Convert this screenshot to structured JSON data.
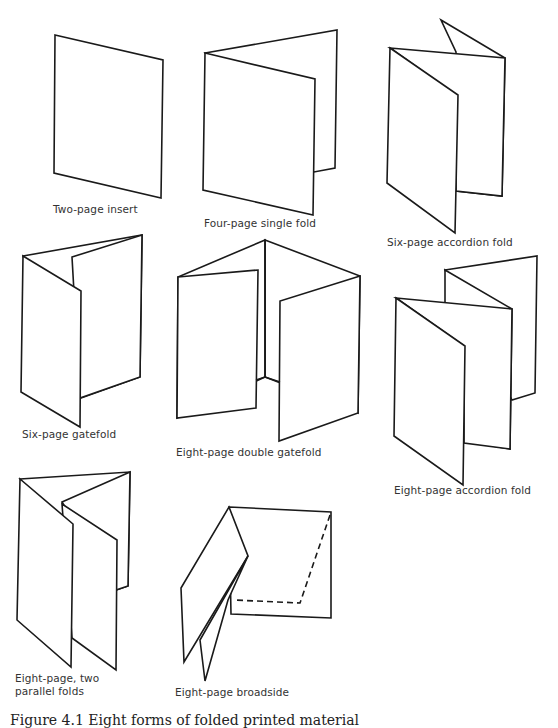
{
  "figure": {
    "stroke_color": "#1a1a1a",
    "items": [
      {
        "id": "two-page-insert",
        "label": "Two-page insert"
      },
      {
        "id": "four-page-single-fold",
        "label": "Four-page single fold"
      },
      {
        "id": "six-page-accordion-fold",
        "label": "Six-page accordion fold"
      },
      {
        "id": "six-page-gatefold",
        "label": "Six-page gatefold"
      },
      {
        "id": "eight-page-double-gatefold",
        "label": "Eight-page double gatefold"
      },
      {
        "id": "eight-page-accordion-fold",
        "label": "Eight-page accordion fold"
      },
      {
        "id": "eight-page-two-parallel-folds",
        "label_line1": "Eight-page, two",
        "label_line2": "parallel folds"
      },
      {
        "id": "eight-page-broadside",
        "label": "Eight-page broadside"
      }
    ],
    "caption": "Figure 4.1  Eight forms of folded printed material"
  }
}
